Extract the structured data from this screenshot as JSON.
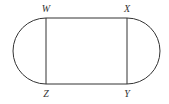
{
  "diagram": {
    "stroke_color": "#333333",
    "labels": {
      "W": "W",
      "X": "X",
      "Y": "Y",
      "Z": "Z"
    },
    "vertices": {
      "W": [
        46,
        18
      ],
      "X": [
        127,
        18
      ],
      "Y": [
        127,
        84
      ],
      "Z": [
        46,
        84
      ]
    }
  }
}
